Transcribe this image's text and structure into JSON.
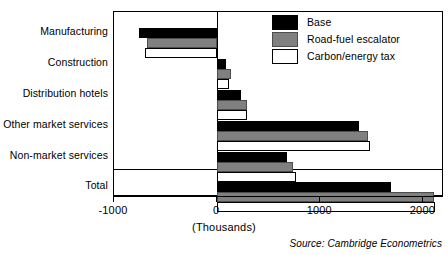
{
  "chart_data": {
    "type": "bar",
    "orientation": "horizontal",
    "title": "",
    "xlabel": "(Thousands)",
    "ylabel": "",
    "xlim": [
      -1000,
      2200
    ],
    "xticks": [
      -1000,
      0,
      1000,
      2000
    ],
    "xticklabels": [
      "-1000",
      "0",
      "1000",
      "2000"
    ],
    "grid": false,
    "legend_position": "top-right",
    "categories": [
      "Manufacturing",
      "Construction",
      "Distribution hotels",
      "Other market services",
      "Non-market services",
      "Total"
    ],
    "series": [
      {
        "name": "Base",
        "color": "#000000",
        "values": [
          -755,
          90,
          230,
          1380,
          680,
          1690
        ]
      },
      {
        "name": "Road-fuel escalator",
        "color": "#808080",
        "values": [
          -680,
          135,
          295,
          1460,
          735,
          2100
        ]
      },
      {
        "name": "Carbon/energy tax",
        "color": "#ffffff",
        "values": [
          -700,
          115,
          295,
          1480,
          765,
          2110
        ]
      }
    ],
    "source": "Source: Cambridge Econometrics"
  },
  "legend": {
    "items": [
      {
        "label": "Base",
        "swatch": "base"
      },
      {
        "label": "Road-fuel escalator",
        "swatch": "escalator"
      },
      {
        "label": "Carbon/energy tax",
        "swatch": "carbon"
      }
    ]
  }
}
